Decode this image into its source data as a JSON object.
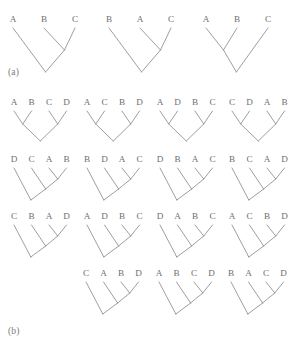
{
  "figure": {
    "panels": [
      {
        "id": "a",
        "label": "(a)",
        "taxon_count": 3,
        "tree_count": 3
      },
      {
        "id": "b",
        "label": "(b)",
        "taxon_count": 4,
        "tree_count": 15
      }
    ],
    "colors": {
      "line": "#8d8d8d",
      "text": "#6f6f6f",
      "background": "#ffffff"
    }
  },
  "panel_a": {
    "label": "(a)",
    "trees": [
      {
        "index": 1,
        "tips": [
          "A",
          "B",
          "C"
        ],
        "topology": "(A,(B,C))",
        "shape": "pectinate-left"
      },
      {
        "index": 2,
        "tips": [
          "B",
          "A",
          "C"
        ],
        "topology": "(B,(A,C))",
        "shape": "pectinate-left"
      },
      {
        "index": 3,
        "tips": [
          "A",
          "B",
          "C"
        ],
        "topology": "((A,B),C)",
        "shape": "pectinate-right"
      }
    ]
  },
  "panel_b": {
    "label": "(b)",
    "rows": [
      {
        "row": 1,
        "shape": "balanced",
        "trees": [
          {
            "index": 1,
            "tips": [
              "A",
              "B",
              "C",
              "D"
            ],
            "topology": "((A,B),(C,D))"
          },
          {
            "index": 2,
            "tips": [
              "A",
              "C",
              "B",
              "D"
            ],
            "topology": "((A,C),(B,D))"
          },
          {
            "index": 3,
            "tips": [
              "A",
              "D",
              "B",
              "C"
            ],
            "topology": "((A,D),(B,C))"
          },
          {
            "index": 4,
            "tips": [
              "C",
              "D",
              "A",
              "B"
            ],
            "topology": "((C,D),(A,B))"
          }
        ]
      },
      {
        "row": 2,
        "shape": "caterpillar",
        "trees": [
          {
            "index": 5,
            "tips": [
              "D",
              "C",
              "A",
              "B"
            ],
            "topology": "(D,(C,(A,B)))"
          },
          {
            "index": 6,
            "tips": [
              "B",
              "D",
              "A",
              "C"
            ],
            "topology": "(B,(D,(A,C)))"
          },
          {
            "index": 7,
            "tips": [
              "D",
              "B",
              "A",
              "C"
            ],
            "topology": "(D,(B,(A,C)))"
          },
          {
            "index": 8,
            "tips": [
              "B",
              "C",
              "A",
              "D"
            ],
            "topology": "(B,(C,(A,D)))"
          }
        ]
      },
      {
        "row": 3,
        "shape": "caterpillar",
        "trees": [
          {
            "index": 9,
            "tips": [
              "C",
              "B",
              "A",
              "D"
            ],
            "topology": "(C,(B,(A,D)))"
          },
          {
            "index": 10,
            "tips": [
              "A",
              "D",
              "B",
              "C"
            ],
            "topology": "(A,(D,(B,C)))"
          },
          {
            "index": 11,
            "tips": [
              "D",
              "A",
              "B",
              "C"
            ],
            "topology": "(D,(A,(B,C)))"
          },
          {
            "index": 12,
            "tips": [
              "A",
              "C",
              "B",
              "D"
            ],
            "topology": "(A,(C,(B,D)))"
          }
        ]
      },
      {
        "row": 4,
        "shape": "caterpillar",
        "trees": [
          {
            "index": 13,
            "tips": [
              "C",
              "A",
              "B",
              "D"
            ],
            "topology": "(C,(A,(B,D)))"
          },
          {
            "index": 14,
            "tips": [
              "A",
              "B",
              "C",
              "D"
            ],
            "topology": "(A,(B,(C,D)))"
          },
          {
            "index": 15,
            "tips": [
              "B",
              "A",
              "C",
              "D"
            ],
            "topology": "(B,(A,(C,D)))"
          }
        ]
      }
    ]
  }
}
